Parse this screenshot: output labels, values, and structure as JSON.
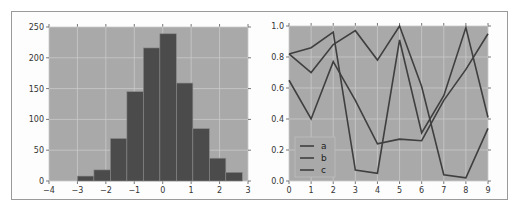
{
  "chart_data": [
    {
      "type": "bar",
      "subtype": "histogram",
      "title": "",
      "xlabel": "",
      "ylabel": "",
      "xlim": [
        -4,
        3
      ],
      "ylim": [
        0,
        250
      ],
      "xticks": [
        -4,
        -3,
        -2,
        -1,
        0,
        1,
        2,
        3
      ],
      "xtick_labels": [
        "−4",
        "−3",
        "−2",
        "−1",
        "0",
        "1",
        "2",
        "3"
      ],
      "yticks": [
        0,
        50,
        100,
        150,
        200,
        250
      ],
      "ytick_labels": [
        "0",
        "50",
        "100",
        "150",
        "200",
        "250"
      ],
      "bin_edges": [
        -3.0,
        -2.42,
        -1.84,
        -1.26,
        -0.68,
        -0.1,
        0.48,
        1.06,
        1.64,
        2.22,
        2.8
      ],
      "values": [
        8,
        18,
        69,
        145,
        216,
        239,
        159,
        85,
        37,
        14
      ],
      "grid": true
    },
    {
      "type": "line",
      "title": "",
      "xlabel": "",
      "ylabel": "",
      "xlim": [
        0,
        9
      ],
      "ylim": [
        0.0,
        1.0
      ],
      "x": [
        0,
        1,
        2,
        3,
        4,
        5,
        6,
        7,
        8,
        9
      ],
      "xtick_labels": [
        "0",
        "1",
        "2",
        "3",
        "4",
        "5",
        "6",
        "7",
        "8",
        "9"
      ],
      "yticks": [
        0.0,
        0.2,
        0.4,
        0.6,
        0.8,
        1.0
      ],
      "ytick_labels": [
        "0.0",
        "0.2",
        "0.4",
        "0.6",
        "0.8",
        "1.0"
      ],
      "series": [
        {
          "name": "a",
          "values": [
            0.82,
            0.86,
            0.96,
            0.07,
            0.05,
            0.91,
            0.31,
            0.55,
            0.99,
            0.41
          ]
        },
        {
          "name": "b",
          "values": [
            0.82,
            0.7,
            0.88,
            0.97,
            0.78,
            1.0,
            0.61,
            0.04,
            0.02,
            0.34
          ]
        },
        {
          "name": "c",
          "values": [
            0.65,
            0.4,
            0.77,
            0.52,
            0.24,
            0.27,
            0.26,
            0.52,
            0.72,
            0.95
          ]
        }
      ],
      "legend": {
        "position": "lower left",
        "entries": [
          "a",
          "b",
          "c"
        ]
      },
      "grid": true
    }
  ],
  "colors": {
    "axes_bg": "#a9a9a9",
    "grid": "#c9c9c9",
    "bar": "#4b4b4b",
    "bar_edge": "#8a8a8a",
    "line": "#3f3f3f",
    "frame": "#9a9a9a"
  }
}
